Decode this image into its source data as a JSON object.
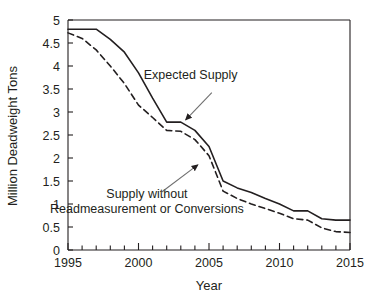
{
  "chart_data": {
    "type": "line",
    "title": "",
    "xlabel": "Year",
    "ylabel": "Million Deadweight Tons",
    "xlim": [
      1995,
      2015
    ],
    "ylim": [
      0,
      5
    ],
    "grid": false,
    "legend_position": "none",
    "x_ticks_major": [
      1995,
      2000,
      2005,
      2010,
      2015
    ],
    "x_tick_labels": [
      "1995",
      "2000",
      "2005",
      "2010",
      "2015"
    ],
    "x_ticks_minor_step": 1,
    "y_ticks": [
      0,
      0.5,
      1,
      1.5,
      2,
      2.5,
      3,
      3.5,
      4,
      4.5,
      5
    ],
    "y_tick_labels": [
      "0",
      "0.5",
      "1",
      "1.5",
      "2",
      "2.5",
      "3",
      "3.5",
      "4",
      "4.5",
      "5"
    ],
    "x": [
      1995,
      1996,
      1997,
      1998,
      1999,
      2000,
      2001,
      2002,
      2003,
      2004,
      2005,
      2006,
      2007,
      2008,
      2009,
      2010,
      2011,
      2012,
      2013,
      2014,
      2015
    ],
    "series": [
      {
        "name": "Expected Supply",
        "style": "solid",
        "color": "#231f20",
        "values": [
          4.8,
          4.8,
          4.8,
          4.58,
          4.3,
          3.85,
          3.3,
          2.78,
          2.78,
          2.6,
          2.25,
          1.5,
          1.35,
          1.25,
          1.12,
          1.0,
          0.85,
          0.85,
          0.68,
          0.65,
          0.65
        ]
      },
      {
        "name": "Supply without Readmeasurement or Conversions",
        "style": "dashed",
        "color": "#231f20",
        "values": [
          4.72,
          4.6,
          4.35,
          4.0,
          3.62,
          3.15,
          2.88,
          2.6,
          2.58,
          2.4,
          2.05,
          1.28,
          1.12,
          1.0,
          0.9,
          0.8,
          0.68,
          0.65,
          0.48,
          0.4,
          0.38
        ]
      }
    ],
    "annotations": [
      {
        "name": "expected-supply",
        "lines": [
          "Expected Supply"
        ],
        "text_x": 2003.7,
        "text_y": 3.72,
        "arrow_from_x": 2005.2,
        "arrow_from_y": 3.42,
        "arrow_to_x": 2003.35,
        "arrow_to_y": 2.83
      },
      {
        "name": "supply-without-readmeasurement",
        "lines": [
          "Supply without",
          "Readmeasurement or Conversions"
        ],
        "text_x": 2000.6,
        "text_y": 1.12,
        "arrow_from_x": 2001.6,
        "arrow_from_y": 1.25,
        "arrow_to_x": 2004.2,
        "arrow_to_y": 1.85
      }
    ]
  }
}
